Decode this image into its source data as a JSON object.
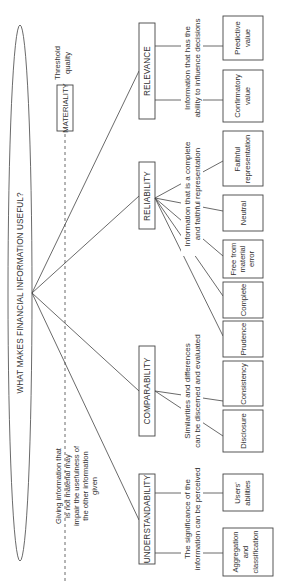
{
  "title": "WHAT MAKES FINANCIAL INFORMATION USEFUL?",
  "threshold": {
    "label_lines": [
      "Threshold",
      "quality"
    ],
    "box": "MATERIALITY",
    "note_lines": [
      "Giving information that",
      "is not material may",
      "impair the usefulness of",
      "the other information",
      "given"
    ]
  },
  "qualities": [
    {
      "name": "RELEVANCE",
      "desc_lines": [
        "Information that has the",
        "ability to influence decisions"
      ],
      "children": [
        [
          "Predictive",
          "value"
        ],
        [
          "Confirmatory",
          "value"
        ]
      ]
    },
    {
      "name": "RELIABILITY",
      "desc_lines": [
        "Information that is a complete",
        "and faithful representation"
      ],
      "children": [
        [
          "Faithful",
          "representation"
        ],
        [
          "Neutral"
        ],
        [
          "Free from",
          "material",
          "error"
        ],
        [
          "Complete"
        ],
        [
          "Prudence"
        ]
      ]
    },
    {
      "name": "COMPARABILITY",
      "desc_lines": [
        "Similarities and differences",
        "can be discerned and evaluated"
      ],
      "children": [
        [
          "Consistency"
        ],
        [
          "Disclosure"
        ]
      ]
    },
    {
      "name": "UNDERSTANDABILITY",
      "desc_lines": [
        "The significance of the",
        "information can be perceived"
      ],
      "children": [
        [
          "Users'",
          "abilities"
        ],
        [
          "Aggregation",
          "and",
          "classification"
        ]
      ]
    }
  ]
}
